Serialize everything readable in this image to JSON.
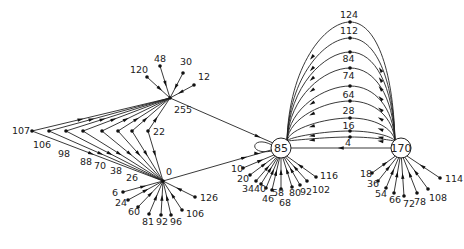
{
  "diagram": {
    "type": "state-transition-graph",
    "colors": {
      "ink": "#222222",
      "background": "#ffffff"
    },
    "hubs": [
      {
        "id": "255",
        "label": "255",
        "x": 170,
        "y": 98,
        "circled": false
      },
      {
        "id": "0",
        "label": "0",
        "x": 163,
        "y": 181,
        "circled": false
      },
      {
        "id": "85",
        "label": "85",
        "x": 281,
        "y": 148,
        "circled": true
      },
      {
        "id": "170",
        "label": "170",
        "x": 401,
        "y": 148,
        "circled": true
      }
    ],
    "fan_255": [
      {
        "label": "120",
        "x": 147,
        "y": 77,
        "lx": 130,
        "ly": 73
      },
      {
        "label": "48",
        "x": 160,
        "y": 66,
        "lx": 154,
        "ly": 62
      },
      {
        "label": "30",
        "x": 183,
        "y": 73,
        "lx": 180,
        "ly": 65
      },
      {
        "label": "12",
        "x": 194,
        "y": 85,
        "lx": 198,
        "ly": 80
      }
    ],
    "left_bridge": [
      {
        "label": "107",
        "x": 32,
        "y": 131,
        "lx": 12,
        "ly": 134
      },
      {
        "label": "106",
        "x": 49,
        "y": 131,
        "lx": 33,
        "ly": 148
      },
      {
        "label": "98",
        "x": 66,
        "y": 131,
        "lx": 58,
        "ly": 157
      },
      {
        "label": "88",
        "x": 83,
        "y": 131,
        "lx": 80,
        "ly": 165
      },
      {
        "label": "70",
        "x": 102,
        "y": 131,
        "lx": 94,
        "ly": 169
      },
      {
        "label": "38",
        "x": 118,
        "y": 131,
        "lx": 110,
        "ly": 174
      },
      {
        "label": "26",
        "x": 132,
        "y": 131,
        "lx": 126,
        "ly": 181
      },
      {
        "label": "22",
        "x": 148,
        "y": 131,
        "lx": 153,
        "ly": 135
      }
    ],
    "hub_255_label": {
      "text": "255",
      "x": 174,
      "y": 113
    },
    "hub_0_label": {
      "text": "0",
      "x": 166,
      "y": 175
    },
    "fan_0": [
      {
        "label": "6",
        "x": 123,
        "y": 192,
        "lx": 112,
        "ly": 196
      },
      {
        "label": "24",
        "x": 128,
        "y": 200,
        "lx": 115,
        "ly": 206
      },
      {
        "label": "60",
        "x": 138,
        "y": 207,
        "lx": 128,
        "ly": 215
      },
      {
        "label": "81",
        "x": 149,
        "y": 214,
        "lx": 142,
        "ly": 225
      },
      {
        "label": "92",
        "x": 161,
        "y": 215,
        "lx": 156,
        "ly": 225
      },
      {
        "label": "96",
        "x": 171,
        "y": 215,
        "lx": 170,
        "ly": 225
      },
      {
        "label": "106",
        "x": 182,
        "y": 210,
        "lx": 186,
        "ly": 217
      },
      {
        "label": "126",
        "x": 195,
        "y": 197,
        "lx": 200,
        "ly": 201
      }
    ],
    "fan_85": [
      {
        "label": "10",
        "x": 243,
        "y": 168,
        "lx": 231,
        "ly": 172
      },
      {
        "label": "20",
        "x": 250,
        "y": 175,
        "lx": 237,
        "ly": 182
      },
      {
        "label": "34",
        "x": 256,
        "y": 181,
        "lx": 242,
        "ly": 192
      },
      {
        "label": "40",
        "x": 261,
        "y": 184,
        "lx": 254,
        "ly": 192
      },
      {
        "label": "46",
        "x": 266,
        "y": 188,
        "lx": 262,
        "ly": 202
      },
      {
        "label": "58",
        "x": 272,
        "y": 190,
        "lx": 272,
        "ly": 196
      },
      {
        "label": "68",
        "x": 281,
        "y": 189,
        "lx": 279,
        "ly": 206
      },
      {
        "label": "80",
        "x": 292,
        "y": 187,
        "lx": 289,
        "ly": 196
      },
      {
        "label": "92",
        "x": 300,
        "y": 185,
        "lx": 300,
        "ly": 195
      },
      {
        "label": "102",
        "x": 307,
        "y": 181,
        "lx": 312,
        "ly": 193
      },
      {
        "label": "116",
        "x": 316,
        "y": 177,
        "lx": 320,
        "ly": 179
      }
    ],
    "fan_170": [
      {
        "label": "18",
        "x": 372,
        "y": 173,
        "lx": 360,
        "ly": 177
      },
      {
        "label": "36",
        "x": 378,
        "y": 181,
        "lx": 367,
        "ly": 187
      },
      {
        "label": "54",
        "x": 386,
        "y": 188,
        "lx": 375,
        "ly": 197
      },
      {
        "label": "66",
        "x": 394,
        "y": 193,
        "lx": 389,
        "ly": 203
      },
      {
        "label": "72",
        "x": 404,
        "y": 196,
        "lx": 403,
        "ly": 207
      },
      {
        "label": "78",
        "x": 417,
        "y": 193,
        "lx": 414,
        "ly": 205
      },
      {
        "label": "108",
        "x": 428,
        "y": 189,
        "lx": 429,
        "ly": 201
      },
      {
        "label": "114",
        "x": 440,
        "y": 178,
        "lx": 445,
        "ly": 182
      }
    ],
    "arc_nodes": [
      {
        "label": "124",
        "y": 22,
        "ly": 14
      },
      {
        "label": "112",
        "y": 38,
        "ly": 30
      },
      {
        "label": "",
        "y": 52,
        "ly": 0
      },
      {
        "label": "84",
        "y": 68,
        "ly": 58
      },
      {
        "label": "74",
        "y": 86,
        "ly": 75
      },
      {
        "label": "64",
        "y": 101,
        "ly": 94
      },
      {
        "label": "28",
        "y": 118,
        "ly": 110
      },
      {
        "label": "16",
        "y": 131,
        "ly": 125
      },
      {
        "label": "4",
        "y": 137,
        "ly": 142
      }
    ],
    "arc_center_x": 350
  }
}
